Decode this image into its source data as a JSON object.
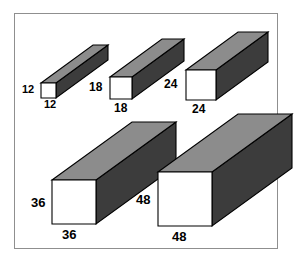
{
  "figure": {
    "background_color": "#ffffff",
    "frame_color": "#8f8f8f",
    "colors": {
      "front_face": "#ffffff",
      "top_face": "#8c8c8c",
      "side_face": "#3c3c3c",
      "outline": "#000000",
      "label_text": "#000000"
    },
    "prisms": [
      {
        "id": "prism-12",
        "height_label": "12",
        "width_label": "12",
        "front_x": 41,
        "front_y": 83,
        "front_size": 15,
        "depth_dx": 52,
        "depth_dy": -38,
        "label_font": "size-sm",
        "height_label_x": 22,
        "height_label_y": 84,
        "width_label_x": 44,
        "width_label_y": 99
      },
      {
        "id": "prism-18",
        "height_label": "18",
        "width_label": "18",
        "front_x": 110,
        "front_y": 77,
        "front_size": 22,
        "depth_dx": 52,
        "depth_dy": -38,
        "label_font": "size-md",
        "height_label_x": 89,
        "height_label_y": 81,
        "width_label_x": 114,
        "width_label_y": 102
      },
      {
        "id": "prism-24",
        "height_label": "24",
        "width_label": "24",
        "front_x": 186,
        "front_y": 70,
        "front_size": 30,
        "depth_dx": 52,
        "depth_dy": -38,
        "label_font": "size-md",
        "height_label_x": 164,
        "height_label_y": 78,
        "width_label_x": 192,
        "width_label_y": 103
      },
      {
        "id": "prism-36",
        "height_label": "36",
        "width_label": "36",
        "front_x": 52,
        "front_y": 180,
        "front_size": 44,
        "depth_dx": 80,
        "depth_dy": -58,
        "label_font": "size-lg",
        "height_label_x": 31,
        "height_label_y": 196,
        "width_label_x": 62,
        "width_label_y": 228
      },
      {
        "id": "prism-48",
        "height_label": "48",
        "width_label": "48",
        "front_x": 158,
        "front_y": 172,
        "front_size": 54,
        "depth_dx": 80,
        "depth_dy": -58,
        "label_font": "size-lg",
        "height_label_x": 136,
        "height_label_y": 193,
        "width_label_x": 172,
        "width_label_y": 230
      }
    ]
  }
}
